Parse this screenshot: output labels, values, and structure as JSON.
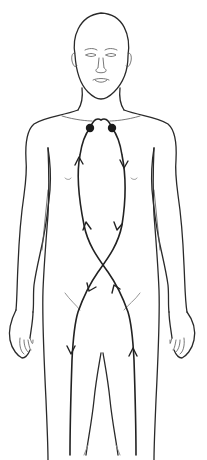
{
  "diagram": {
    "figure": {
      "view": "anterior",
      "parts": [
        "head",
        "face",
        "neck",
        "shoulders",
        "torso",
        "arms",
        "hands",
        "legs"
      ]
    },
    "points": [
      {
        "name": "left-collarbone-point",
        "x": 90,
        "y": 128
      },
      {
        "name": "right-collarbone-point",
        "x": 112,
        "y": 128
      }
    ],
    "pathways": [
      {
        "name": "descending-path",
        "from": "right-collarbone-point",
        "direction": "down",
        "crosses_at_y": 268,
        "ends": "left-leg"
      },
      {
        "name": "ascending-path",
        "from": "right-leg",
        "direction": "up",
        "crosses_at_y": 268,
        "ends": "left-collarbone-point"
      }
    ],
    "colors": {
      "line": "#2a2a2a",
      "dot": "#1a1a1a",
      "background": "#ffffff"
    }
  }
}
